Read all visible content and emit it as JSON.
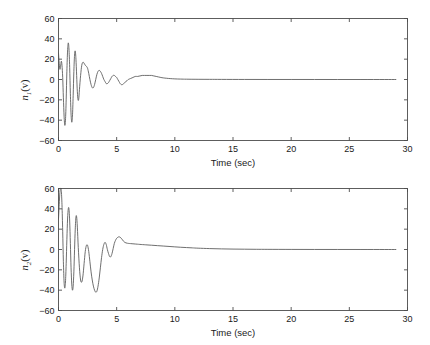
{
  "figure": {
    "background": "#ffffff",
    "line_color": "#555555",
    "axis_color": "#4d4d4d",
    "width": 430,
    "height": 345
  },
  "chart_data": [
    {
      "type": "line",
      "id": "top-subplot",
      "title": "",
      "xlabel": "Time (sec)",
      "ylabel": "n_1(v)",
      "ylabel_base": "n",
      "ylabel_sub": "1",
      "ylabel_tail": "(v)",
      "xlim": [
        0,
        30
      ],
      "ylim": [
        -60,
        60
      ],
      "xticks": [
        0,
        5,
        10,
        15,
        20,
        25,
        30
      ],
      "xticklabels": [
        "0",
        "5",
        "10",
        "15",
        "20",
        "25",
        "30"
      ],
      "yticks": [
        -60,
        -40,
        -20,
        0,
        20,
        40,
        60
      ],
      "yticklabels": [
        "60",
        "40",
        "20",
        "0",
        "-20",
        "-40",
        "-60"
      ],
      "grid": false,
      "legend": null,
      "series": [
        {
          "name": "n1",
          "description": "Damped oscillatory transient decaying to zero by about 10 sec",
          "x": [
            0.0,
            0.06,
            0.12,
            0.18,
            0.24,
            0.3,
            0.36,
            0.42,
            0.48,
            0.54,
            0.6,
            0.66,
            0.72,
            0.78,
            0.84,
            0.9,
            0.96,
            1.02,
            1.08,
            1.14,
            1.2,
            1.26,
            1.32,
            1.38,
            1.44,
            1.5,
            1.56,
            1.62,
            1.68,
            1.74,
            1.8,
            1.9,
            2.0,
            2.1,
            2.2,
            2.3,
            2.4,
            2.5,
            2.6,
            2.7,
            2.8,
            2.9,
            3.0,
            3.1,
            3.2,
            3.3,
            3.4,
            3.5,
            3.6,
            3.7,
            3.8,
            3.9,
            4.0,
            4.1,
            4.2,
            4.3,
            4.4,
            4.5,
            4.6,
            4.7,
            4.8,
            4.9,
            5.0,
            5.1,
            5.2,
            5.3,
            5.4,
            5.5,
            5.6,
            5.7,
            5.8,
            5.9,
            6.0,
            6.2,
            6.4,
            6.6,
            6.8,
            7.0,
            7.2,
            7.4,
            7.6,
            7.8,
            8.0,
            8.2,
            8.4,
            8.6,
            8.8,
            9.0,
            9.3,
            9.6,
            10.0,
            10.5,
            11.0,
            12.0,
            13.0,
            14.0,
            16.0,
            18.0,
            20.0,
            22.0,
            24.0,
            26.0,
            28.0,
            29.0
          ],
          "y": [
            26.0,
            16.0,
            10.0,
            13.0,
            18.0,
            14.0,
            2.0,
            -18.0,
            -36.0,
            -45.0,
            -40.0,
            -20.0,
            8.0,
            28.0,
            36.0,
            30.0,
            12.0,
            -14.0,
            -34.0,
            -42.0,
            -36.0,
            -16.0,
            8.0,
            24.0,
            28.0,
            20.0,
            4.0,
            -12.0,
            -20.0,
            -19.0,
            -10.0,
            4.0,
            14.0,
            17.0,
            16.0,
            14.0,
            13.0,
            11.0,
            6.0,
            0.0,
            -5.0,
            -8.0,
            -8.0,
            -5.0,
            0.0,
            5.0,
            8.0,
            9.0,
            8.0,
            6.0,
            3.0,
            0.0,
            -2.0,
            -4.0,
            -4.0,
            -3.0,
            -1.0,
            1.0,
            3.0,
            4.0,
            4.0,
            3.0,
            2.0,
            0.0,
            -2.0,
            -4.0,
            -5.0,
            -5.0,
            -4.0,
            -3.0,
            -2.0,
            -1.0,
            0.0,
            1.0,
            2.0,
            3.0,
            3.0,
            3.5,
            4.0,
            4.0,
            4.0,
            4.0,
            4.0,
            3.5,
            3.0,
            2.5,
            2.0,
            1.6,
            1.2,
            0.9,
            0.6,
            0.4,
            0.3,
            0.2,
            0.15,
            0.1,
            0.05,
            0.03,
            0.02,
            0.01,
            0.0,
            0.0,
            0.0,
            0.0
          ]
        }
      ]
    },
    {
      "type": "line",
      "id": "bottom-subplot",
      "title": "",
      "xlabel": "Time (sec)",
      "ylabel": "n_2(v)",
      "ylabel_base": "n",
      "ylabel_sub": "2",
      "ylabel_tail": "(v)",
      "xlim": [
        0,
        30
      ],
      "ylim": [
        -60,
        60
      ],
      "xticks": [
        0,
        5,
        10,
        15,
        20,
        25,
        30
      ],
      "xticklabels": [
        "0",
        "5",
        "10",
        "15",
        "20",
        "25",
        "30"
      ],
      "yticks": [
        -60,
        -40,
        -20,
        0,
        20,
        40,
        60
      ],
      "yticklabels": [
        "60",
        "40",
        "20",
        "0",
        "-20",
        "-40",
        "-60"
      ],
      "grid": false,
      "legend": null,
      "series": [
        {
          "name": "n2",
          "description": "Larger damped oscillatory transient, peaks clipped near +60, settling to zero after about 12 sec",
          "x": [
            0.0,
            0.06,
            0.12,
            0.18,
            0.24,
            0.3,
            0.36,
            0.42,
            0.48,
            0.54,
            0.6,
            0.66,
            0.72,
            0.78,
            0.84,
            0.9,
            0.96,
            1.02,
            1.08,
            1.14,
            1.2,
            1.26,
            1.32,
            1.38,
            1.44,
            1.5,
            1.56,
            1.62,
            1.7,
            1.8,
            1.9,
            2.0,
            2.1,
            2.2,
            2.3,
            2.4,
            2.5,
            2.6,
            2.7,
            2.8,
            2.9,
            3.0,
            3.1,
            3.2,
            3.3,
            3.4,
            3.5,
            3.6,
            3.7,
            3.8,
            3.9,
            4.0,
            4.1,
            4.2,
            4.3,
            4.4,
            4.5,
            4.6,
            4.7,
            4.8,
            4.9,
            5.0,
            5.1,
            5.2,
            5.3,
            5.4,
            5.5,
            5.6,
            5.7,
            5.8,
            5.9,
            6.0,
            6.2,
            6.4,
            6.6,
            6.8,
            7.0,
            7.5,
            8.0,
            8.5,
            9.0,
            9.5,
            10.0,
            10.5,
            11.0,
            11.5,
            12.0,
            13.0,
            14.0,
            15.0,
            16.0,
            17.0,
            18.0,
            20.0,
            22.0,
            24.0,
            26.0,
            28.0,
            29.0
          ],
          "y": [
            30.0,
            44.0,
            56.0,
            60.0,
            58.0,
            44.0,
            18.0,
            -12.0,
            -32.0,
            -38.0,
            -32.0,
            -14.0,
            10.0,
            30.0,
            40.0,
            40.0,
            28.0,
            6.0,
            -18.0,
            -34.0,
            -40.0,
            -36.0,
            -22.0,
            0.0,
            20.0,
            32.0,
            32.0,
            22.0,
            2.0,
            -18.0,
            -30.0,
            -32.0,
            -26.0,
            -14.0,
            -2.0,
            4.0,
            4.0,
            -2.0,
            -12.0,
            -22.0,
            -30.0,
            -36.0,
            -40.0,
            -42.0,
            -41.0,
            -36.0,
            -28.0,
            -18.0,
            -8.0,
            0.0,
            5.0,
            7.0,
            5.0,
            0.0,
            -4.0,
            -7.0,
            -7.0,
            -4.0,
            1.0,
            6.0,
            9.0,
            11.0,
            12.0,
            12.5,
            12.0,
            11.0,
            9.5,
            8.0,
            7.0,
            6.5,
            6.2,
            6.0,
            5.8,
            5.6,
            5.4,
            5.2,
            5.0,
            4.6,
            4.2,
            3.8,
            3.4,
            3.0,
            2.6,
            2.2,
            1.9,
            1.6,
            1.3,
            0.9,
            0.6,
            0.4,
            0.3,
            0.2,
            0.15,
            0.08,
            0.04,
            0.02,
            0.01,
            0.0,
            0.0
          ]
        }
      ]
    }
  ]
}
